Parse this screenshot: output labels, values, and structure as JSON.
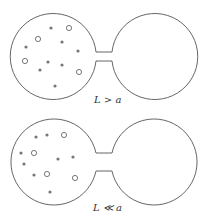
{
  "diagrams": [
    {
      "label": "L > a",
      "neck": "narrow",
      "filled_dots": [
        [
          51,
          28
        ],
        [
          26,
          47
        ],
        [
          62,
          42
        ],
        [
          78,
          51
        ],
        [
          48,
          62
        ],
        [
          40,
          70
        ],
        [
          62,
          65
        ],
        [
          55,
          86
        ]
      ],
      "open_circles": [
        [
          69,
          28
        ],
        [
          38,
          39
        ],
        [
          25,
          61
        ],
        [
          79,
          72
        ]
      ]
    },
    {
      "label": "L ≪ a",
      "neck": "wide",
      "filled_dots": [
        [
          36,
          137
        ],
        [
          47,
          135
        ],
        [
          21,
          153
        ],
        [
          24,
          164
        ],
        [
          58,
          159
        ],
        [
          73,
          157
        ],
        [
          34,
          175
        ],
        [
          50,
          192
        ]
      ],
      "open_circles": [
        [
          64,
          135
        ],
        [
          34,
          153
        ],
        [
          47,
          174
        ],
        [
          75,
          178
        ]
      ]
    }
  ],
  "colors": {
    "outline": "#555555",
    "dot": "#777777"
  }
}
